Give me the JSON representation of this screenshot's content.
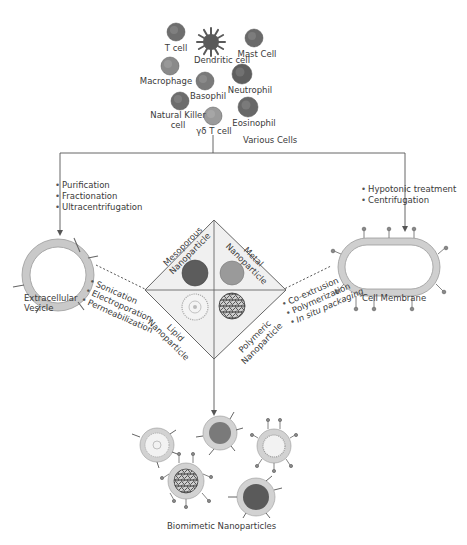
{
  "cells": {
    "title": "Various Cells",
    "items": [
      {
        "label": "T cell",
        "x": 176,
        "y": 32,
        "r": 9,
        "color": "#6e6e6e",
        "lx": 176,
        "ly": 44
      },
      {
        "label": "Dendritic cell",
        "x": 211,
        "y": 42,
        "r": 8,
        "color": "#5a5a5a",
        "lx": 222,
        "ly": 56,
        "spiky": true
      },
      {
        "label": "Mast Cell",
        "x": 254,
        "y": 38,
        "r": 9,
        "color": "#6a6a6a",
        "lx": 257,
        "ly": 50
      },
      {
        "label": "Macrophage",
        "x": 170,
        "y": 66,
        "r": 9,
        "color": "#8a8a8a",
        "lx": 166,
        "ly": 77
      },
      {
        "label": "Basophil",
        "x": 205,
        "y": 81,
        "r": 9,
        "color": "#7a7a7a",
        "lx": 208,
        "ly": 92
      },
      {
        "label": "Neutrophil",
        "x": 242,
        "y": 74,
        "r": 10,
        "color": "#5e5e5e",
        "lx": 250,
        "ly": 86
      },
      {
        "label": "Natural Killer\ncell",
        "x": 180,
        "y": 101,
        "r": 9,
        "color": "#6c6c6c",
        "lx": 178,
        "ly": 111
      },
      {
        "label": "γδ T cell",
        "x": 213,
        "y": 116,
        "r": 9,
        "color": "#9a9a9a",
        "lx": 214,
        "ly": 127
      },
      {
        "label": "Eosinophil",
        "x": 248,
        "y": 107,
        "r": 10,
        "color": "#686868",
        "lx": 254,
        "ly": 119
      }
    ]
  },
  "left_branch": {
    "steps": [
      "Purification",
      "Fractionation",
      "Ultracentrifugation"
    ],
    "vesicle_label_1": "Extracellular",
    "vesicle_label_2": "Vesicle",
    "methods": [
      "Sonication",
      "Electroporation",
      "Permeabilization"
    ]
  },
  "right_branch": {
    "steps": [
      "Hypotonic treatment",
      "Centrifugation"
    ],
    "membrane_label": "Cell Membrane",
    "methods": [
      "Co-extrusion",
      "Polymerization",
      "In situ packaging"
    ]
  },
  "diamond": {
    "quadrants": [
      {
        "label_1": "Mesoporous",
        "label_2": "Nanoparticle",
        "position": "top-left",
        "color": "#5c5c5c"
      },
      {
        "label_1": "Metal",
        "label_2": "Nanoparticle",
        "position": "top-right",
        "color": "#8e8e8e"
      },
      {
        "label_1": "Lipid",
        "label_2": "Nanoparticle",
        "position": "bottom-left",
        "color": "#d8d8d8"
      },
      {
        "label_1": "Polymeric",
        "label_2": "Nanoparticle",
        "position": "bottom-right",
        "color": "#4a4a4a"
      }
    ]
  },
  "output": {
    "title": "Biomimetic Nanoparticles"
  },
  "colors": {
    "line": "#555555",
    "membrane": "#c8c8c8",
    "membrane_edge": "#9a9a9a",
    "diamond_fill": "#f0f0f0",
    "text": "#3a3a3a"
  }
}
